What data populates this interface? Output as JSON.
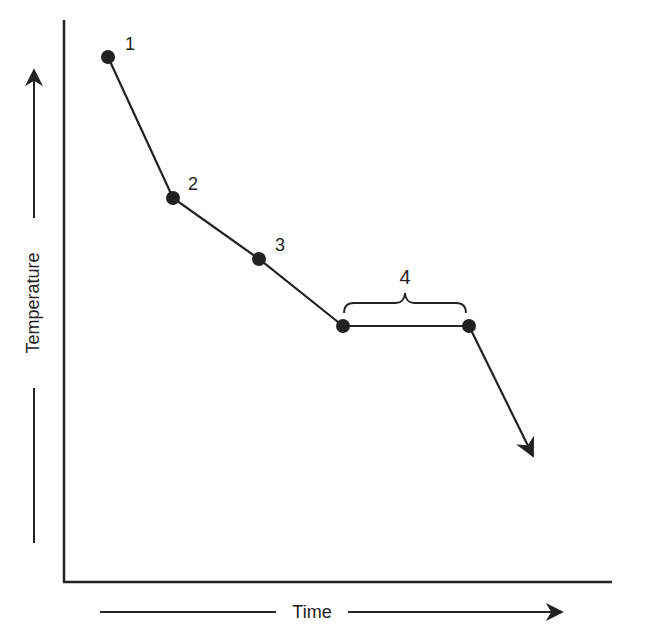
{
  "diagram": {
    "type": "cooling-curve",
    "x_axis_label": "Time",
    "y_axis_label": "Temperature",
    "points": [
      {
        "label": "1",
        "x": 108,
        "y": 57
      },
      {
        "label": "2",
        "x": 173,
        "y": 198
      },
      {
        "label": "3",
        "x": 259,
        "y": 259
      },
      {
        "label": "",
        "x": 343,
        "y": 326
      },
      {
        "label": "",
        "x": 469,
        "y": 326
      }
    ],
    "plateau_label": "4",
    "line_color": "#222222"
  }
}
